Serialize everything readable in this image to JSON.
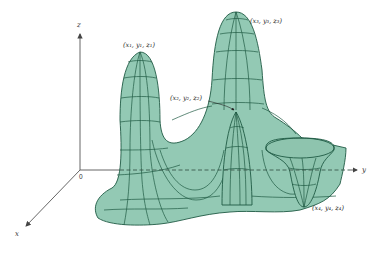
{
  "figure": {
    "type": "3d-surface-plot",
    "surface_color": "#93c9b4",
    "line_color": "#1f5a44",
    "axes": {
      "z_label": "z",
      "y_label": "y",
      "x_label": "x",
      "origin_label": "0"
    },
    "points": [
      {
        "id": "p1",
        "label": "(x₁, y₁, z₁)",
        "kind": "local maximum"
      },
      {
        "id": "p2",
        "label": "(x₂, y₂, z₂)",
        "kind": "local maximum"
      },
      {
        "id": "p3",
        "label": "(x₃, y₃, z₃)",
        "kind": "absolute maximum"
      },
      {
        "id": "p4",
        "label": "(x₄, y₄, z₄)",
        "kind": "local minimum"
      }
    ]
  }
}
